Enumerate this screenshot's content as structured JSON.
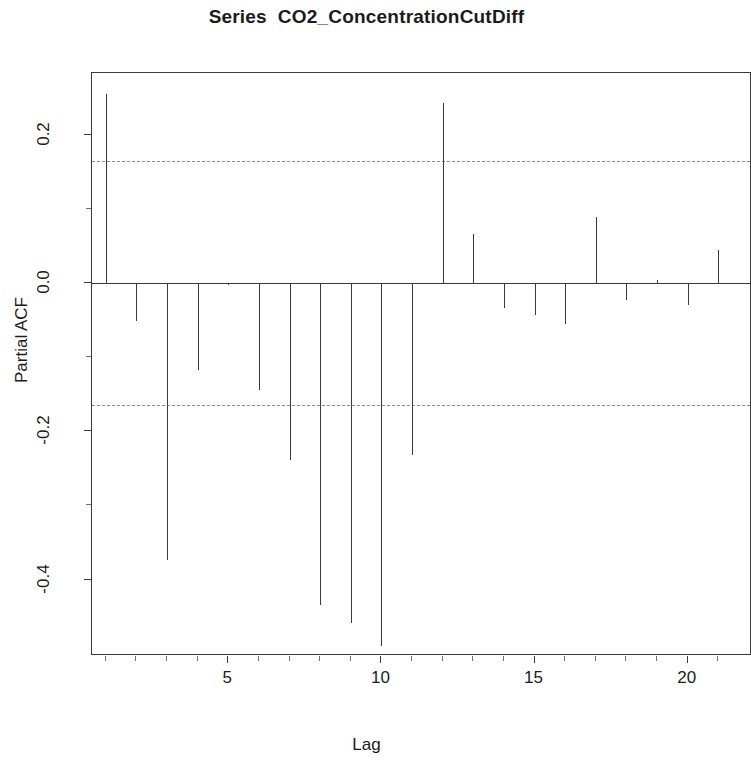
{
  "chart_data": {
    "type": "bar",
    "subtype": "pacf-correlogram",
    "title": "Series  CO2_ConcentrationCutDiff",
    "xlabel": "Lag",
    "ylabel": "Partial ACF",
    "x": [
      1,
      2,
      3,
      4,
      5,
      6,
      7,
      8,
      9,
      10,
      11,
      12,
      13,
      14,
      15,
      16,
      17,
      18,
      19,
      20,
      21
    ],
    "values": [
      0.255,
      -0.051,
      -0.373,
      -0.117,
      -0.003,
      -0.144,
      -0.239,
      -0.434,
      -0.459,
      -0.489,
      -0.232,
      0.243,
      0.066,
      -0.034,
      -0.043,
      -0.056,
      0.089,
      -0.023,
      0.004,
      -0.03,
      0.044
    ],
    "categories": [
      "1",
      "2",
      "3",
      "4",
      "5",
      "6",
      "7",
      "8",
      "9",
      "10",
      "11",
      "12",
      "13",
      "14",
      "15",
      "16",
      "17",
      "18",
      "19",
      "20",
      "21"
    ],
    "ylim": [
      -0.503,
      0.283
    ],
    "xlim": [
      0.55,
      22.1
    ],
    "ytick_values": [
      0.2,
      0.0,
      -0.2,
      -0.4
    ],
    "ytick_labels": [
      "0.2",
      "0.0",
      "-0.2",
      "-0.4"
    ],
    "ytick_minor_values": [
      0.1,
      -0.1,
      -0.3
    ],
    "xtick_values": [
      5,
      10,
      15,
      20
    ],
    "xtick_labels": [
      "5",
      "10",
      "15",
      "20"
    ],
    "xtick_minor_values": [
      1,
      2,
      3,
      4,
      6,
      7,
      8,
      9,
      11,
      12,
      13,
      14,
      16,
      17,
      18,
      19,
      21,
      22
    ],
    "confidence_bounds": [
      0.164,
      -0.165
    ],
    "confidence_level": "95%",
    "grid": false,
    "legend": false,
    "colors": {
      "spike": "#3a3a3a",
      "axis": "#3a3a3a",
      "confidence": "#8c8c8c",
      "background": "#ffffff",
      "text": "#1b1b1b"
    }
  }
}
